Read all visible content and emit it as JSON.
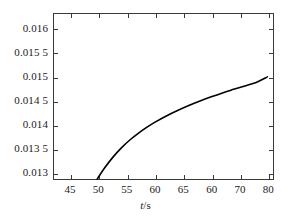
{
  "chart_data": {
    "type": "line",
    "title": "",
    "subtitle": "",
    "xlabel": "t/s",
    "ylabel": "",
    "xlim": [
      42,
      81
    ],
    "ylim": [
      0.01285,
      0.01632
    ],
    "grid": false,
    "legend": null,
    "annotations": [],
    "x_ticks": [
      45,
      50,
      55,
      60,
      65,
      70,
      75,
      80
    ],
    "x_tick_labels": [
      "45",
      "50",
      "55",
      "60",
      "65",
      "60",
      "70",
      "80"
    ],
    "y_ticks": [
      0.013,
      0.0135,
      0.014,
      0.0145,
      0.015,
      0.0155,
      0.016
    ],
    "y_tick_labels": [
      "0.013",
      "0.013 5",
      "0.014",
      "0.014 5",
      "0.015",
      "0.015 5",
      "0.016"
    ],
    "series": [
      {
        "name": "curve",
        "color": "#000000",
        "linewidth": 1.6,
        "x": [
          49.7,
          51,
          52.5,
          54,
          55.5,
          57,
          58.5,
          60,
          62,
          64,
          66,
          68,
          70,
          72,
          74,
          76,
          78,
          80
        ],
        "y": [
          0.01285,
          0.01308,
          0.01331,
          0.013505,
          0.01367,
          0.01381,
          0.013935,
          0.014045,
          0.014175,
          0.01429,
          0.014395,
          0.01449,
          0.014578,
          0.01466,
          0.014735,
          0.014808,
          0.01488,
          0.014998
        ]
      }
    ]
  },
  "axis": {
    "x_title_variable": "t",
    "x_title_unit": "/s"
  }
}
